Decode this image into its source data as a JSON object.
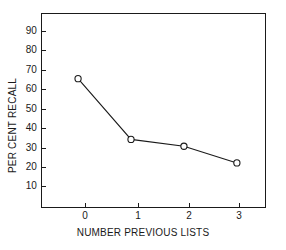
{
  "chart_data": {
    "type": "line",
    "title": "",
    "xlabel": "NUMBER PREVIOUS LISTS",
    "ylabel": "PER CENT RECALL",
    "x": [
      0,
      1,
      2,
      3
    ],
    "values": [
      68,
      37,
      33.5,
      25
    ],
    "series": [
      {
        "name": "per cent recall",
        "x": [
          0,
          1,
          2,
          3
        ],
        "values": [
          68,
          37,
          33.5,
          25
        ]
      }
    ],
    "xtick_labels": [
      "0",
      "1",
      "2",
      "3"
    ],
    "ytick_labels": [
      "10",
      "20",
      "30",
      "40",
      "50",
      "60",
      "70",
      "80",
      "90"
    ],
    "ytick_values": [
      10,
      20,
      30,
      40,
      50,
      60,
      70,
      80,
      90
    ],
    "xlim": [
      -0.7,
      3.55
    ],
    "ylim": [
      2.0,
      101.5
    ],
    "grid": false,
    "legend": false,
    "marker": "open-circle",
    "line_color": "#1a1a1a",
    "marker_color": "#1a1a1a",
    "background_color": "#ffffff",
    "axis_color": "#1a1a1a"
  }
}
